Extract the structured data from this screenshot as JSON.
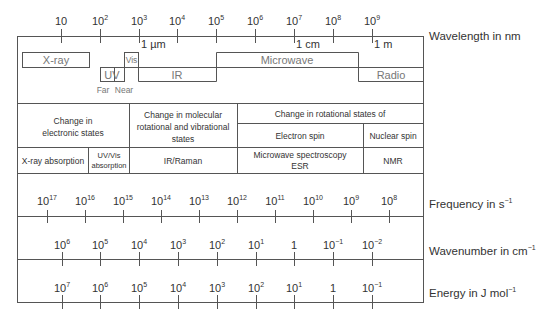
{
  "diagram": {
    "wavelength": {
      "axis_label": "Wavelength in nm",
      "ticks": [
        {
          "base": "10",
          "exp": ""
        },
        {
          "base": "10",
          "exp": "2"
        },
        {
          "base": "10",
          "exp": "3"
        },
        {
          "base": "10",
          "exp": "4"
        },
        {
          "base": "10",
          "exp": "5"
        },
        {
          "base": "10",
          "exp": "6"
        },
        {
          "base": "10",
          "exp": "7"
        },
        {
          "base": "10",
          "exp": "8"
        },
        {
          "base": "10",
          "exp": "9"
        }
      ],
      "markers": {
        "micrometre": "1 µm",
        "centimetre": "1 cm",
        "metre": "1 m"
      }
    },
    "regions": {
      "xray": "X-ray",
      "uv": "UV",
      "far": "Far",
      "near": "Near",
      "vis": "Vis",
      "ir": "IR",
      "microwave": "Microwave",
      "radio": "Radio"
    },
    "table": {
      "row1": {
        "electronic": "Change in electronic states",
        "electronic_lines": [
          "Change in",
          "electronic states"
        ],
        "molecular_lines": [
          "Change in molecular",
          "rotational and vibrational",
          "states"
        ],
        "rotational": "Change in rotational states of"
      },
      "row1b": {
        "electron_spin": "Electron spin",
        "nuclear_spin": "Nuclear spin"
      },
      "row2": {
        "xray_absorption": "X-ray absorption",
        "uvvis_lines": [
          "UV/Vis",
          "absorption"
        ],
        "ir_raman": "IR/Raman",
        "microwave_lines": [
          "Microwave spectroscopy",
          "ESR"
        ],
        "nmr": "NMR"
      }
    },
    "frequency": {
      "axis_label": "Frequency in s",
      "axis_label_exp": "−1",
      "ticks": [
        {
          "base": "10",
          "exp": "17"
        },
        {
          "base": "10",
          "exp": "16"
        },
        {
          "base": "10",
          "exp": "15"
        },
        {
          "base": "10",
          "exp": "14"
        },
        {
          "base": "10",
          "exp": "13"
        },
        {
          "base": "10",
          "exp": "12"
        },
        {
          "base": "10",
          "exp": "11"
        },
        {
          "base": "10",
          "exp": "10"
        },
        {
          "base": "10",
          "exp": "9"
        },
        {
          "base": "10",
          "exp": "8"
        }
      ]
    },
    "wavenumber": {
      "axis_label": "Wavenumber in cm",
      "axis_label_exp": "−1",
      "ticks": [
        {
          "base": "10",
          "exp": "6"
        },
        {
          "base": "10",
          "exp": "5"
        },
        {
          "base": "10",
          "exp": "4"
        },
        {
          "base": "10",
          "exp": "3"
        },
        {
          "base": "10",
          "exp": "2"
        },
        {
          "base": "10",
          "exp": "1"
        },
        {
          "base": "1",
          "exp": ""
        },
        {
          "base": "10",
          "exp": "−1"
        },
        {
          "base": "10",
          "exp": "−2"
        }
      ]
    },
    "energy": {
      "axis_label": "Energy in J mol",
      "axis_label_exp": "−1",
      "ticks": [
        {
          "base": "10",
          "exp": "7"
        },
        {
          "base": "10",
          "exp": "6"
        },
        {
          "base": "10",
          "exp": "5"
        },
        {
          "base": "10",
          "exp": "4"
        },
        {
          "base": "10",
          "exp": "3"
        },
        {
          "base": "10",
          "exp": "2"
        },
        {
          "base": "10",
          "exp": "1"
        },
        {
          "base": "1",
          "exp": ""
        },
        {
          "base": "10",
          "exp": "−1"
        }
      ]
    },
    "colors": {
      "line": "#555555",
      "text": "#333333",
      "region_text": "#777777"
    }
  }
}
